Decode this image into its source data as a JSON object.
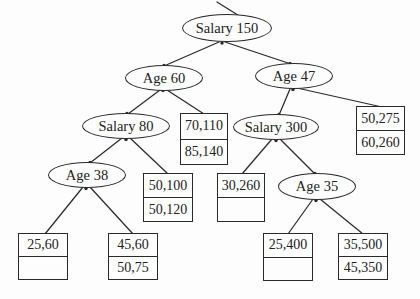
{
  "figure": {
    "background": "#fdfdfd",
    "ink": "#2a2a2a"
  },
  "tree": {
    "nodes": [
      {
        "id": "root",
        "label": "Salary 150",
        "children": [
          "age60",
          "age47"
        ]
      },
      {
        "id": "age60",
        "label": "Age 60",
        "children": [
          "salary80",
          "leaf-70-110"
        ]
      },
      {
        "id": "age47",
        "label": "Age 47",
        "children": [
          "salary300",
          "leaf-50-275"
        ]
      },
      {
        "id": "salary80",
        "label": "Salary 80",
        "children": [
          "age38",
          "leaf-50-100"
        ]
      },
      {
        "id": "salary300",
        "label": "Salary 300",
        "children": [
          "leaf-30-260",
          "age35"
        ]
      },
      {
        "id": "age38",
        "label": "Age 38",
        "children": [
          "leaf-25-60",
          "leaf-45-60"
        ]
      },
      {
        "id": "age35",
        "label": "Age 35",
        "children": [
          "leaf-25-400",
          "leaf-35-500"
        ]
      }
    ],
    "leaves": [
      {
        "id": "leaf-70-110",
        "cells": [
          "70,110",
          "85,140"
        ]
      },
      {
        "id": "leaf-50-275",
        "cells": [
          "50,275",
          "60,260"
        ]
      },
      {
        "id": "leaf-50-100",
        "cells": [
          "50,100",
          "50,120"
        ]
      },
      {
        "id": "leaf-30-260",
        "cells": [
          "30,260",
          ""
        ]
      },
      {
        "id": "leaf-25-60",
        "cells": [
          "25,60",
          ""
        ]
      },
      {
        "id": "leaf-45-60",
        "cells": [
          "45,60",
          "50,75"
        ]
      },
      {
        "id": "leaf-25-400",
        "cells": [
          "25,400",
          ""
        ]
      },
      {
        "id": "leaf-35-500",
        "cells": [
          "35,500",
          "45,350"
        ]
      }
    ]
  }
}
